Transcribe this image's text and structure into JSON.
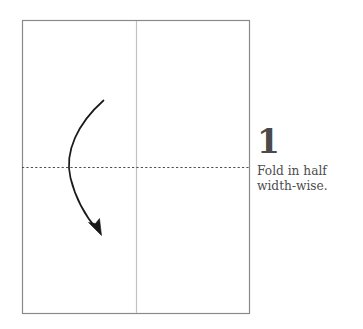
{
  "diagram": {
    "type": "origami-fold-instruction",
    "paper": {
      "shape": "rectangle",
      "x": 22,
      "y": 20,
      "width": 228,
      "height": 294,
      "border_color": "#8a8a8a",
      "fill_color": "#ffffff"
    },
    "center_line": {
      "name": "vertical-center-crease",
      "orientation": "vertical",
      "x": 136,
      "y1": 20,
      "y2": 314,
      "color": "#bdbdbd",
      "style": "solid"
    },
    "fold_line": {
      "name": "horizontal-fold-line",
      "orientation": "horizontal",
      "y": 167,
      "x1": 22,
      "x2": 250,
      "color": "#555555",
      "style": "dashed",
      "dash_pattern": "2 2"
    },
    "fold_arrow": {
      "name": "fold-direction-arrow",
      "start_x": 103,
      "start_y": 100,
      "control_x": 52,
      "control_y": 168,
      "end_x": 99,
      "end_y": 231,
      "color": "#1a1a1a",
      "direction": "downward-curved"
    }
  },
  "caption": {
    "step_number": "1",
    "instruction": "Fold in half\nwidth-wise.",
    "number_color": "#4a4a4a",
    "text_color": "#4d4d4d"
  }
}
